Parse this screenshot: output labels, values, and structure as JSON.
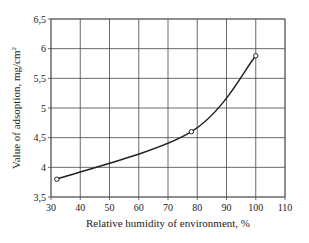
{
  "chart_data": {
    "type": "line",
    "title": "",
    "xlabel": "Relative humidity of environment, %",
    "ylabel": "Value of adsoption, mg/cm²",
    "ylabel_main": "Value of adsoption, mg/cm",
    "ylabel_sup": "2",
    "xlim": [
      30,
      110
    ],
    "ylim": [
      3.5,
      6.5
    ],
    "x_ticks": [
      30,
      40,
      50,
      60,
      70,
      80,
      90,
      100,
      110
    ],
    "x_tick_labels": [
      "30",
      "40",
      "50",
      "60",
      "70",
      "80",
      "90",
      "100",
      "110"
    ],
    "y_ticks": [
      3.5,
      4,
      4.5,
      5,
      5.5,
      6,
      6.5
    ],
    "y_tick_labels": [
      "3,5",
      "4",
      "4,5",
      "5",
      "5,5",
      "6",
      "6,5"
    ],
    "grid": true,
    "legend": null,
    "series": [
      {
        "name": "Adsorption",
        "x": [
          32,
          78,
          100
        ],
        "y": [
          3.8,
          4.6,
          5.88
        ],
        "marker": "open-circle",
        "color": "#222222",
        "smooth": true
      }
    ]
  }
}
